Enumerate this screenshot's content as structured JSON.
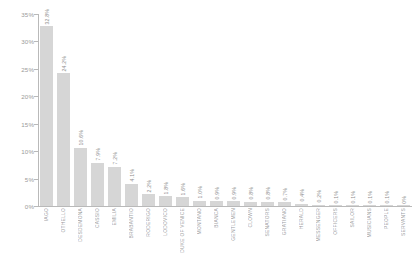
{
  "chart_data": {
    "type": "bar",
    "title": "",
    "subtitle": "",
    "xlabel": "",
    "ylabel": "",
    "ylim": [
      0,
      35
    ],
    "grid": false,
    "legend": null,
    "bar_color": "#d6d6d6",
    "axis_color": "#b9b9b9",
    "label_color": "#9a9a9a",
    "ytick_labels": [
      "0%",
      "5%",
      "10%",
      "15%",
      "20%",
      "25%",
      "30%",
      "35%"
    ],
    "ytick_values": [
      0,
      5,
      10,
      15,
      20,
      25,
      30,
      35
    ],
    "categories": [
      "IAGO",
      "OTHELLO",
      "DESDEMONA",
      "CASSIO",
      "EMILIA",
      "BRABANTIO",
      "RODERIGO",
      "LODOVICO",
      "DUKE OF VENICE",
      "MONTANO",
      "BIANCA",
      "GENTLEMEN",
      "CLOWN",
      "SENATORS",
      "GRATIANO",
      "HERALD",
      "MESSENGER",
      "OFFICERS",
      "SAILOR",
      "MUSICIANS",
      "PEOPLE",
      "SERVANTS"
    ],
    "values": [
      32.8,
      24.2,
      10.6,
      7.9,
      7.2,
      4.1,
      2.2,
      1.8,
      1.6,
      1.0,
      0.9,
      0.9,
      0.8,
      0.8,
      0.7,
      0.4,
      0.2,
      0.1,
      0.1,
      0.1,
      0.1,
      0.0
    ],
    "value_labels": [
      "32.8%",
      "24.2%",
      "10.6%",
      "7.9%",
      "7.2%",
      "4.1%",
      "2.2%",
      "1.8%",
      "1.6%",
      "1.0%",
      "0.9%",
      "0.9%",
      "0.8%",
      "0.8%",
      "0.7%",
      "0.4%",
      "0.2%",
      "0.1%",
      "0.1%",
      "0.1%",
      "0.1%",
      "0%"
    ]
  }
}
